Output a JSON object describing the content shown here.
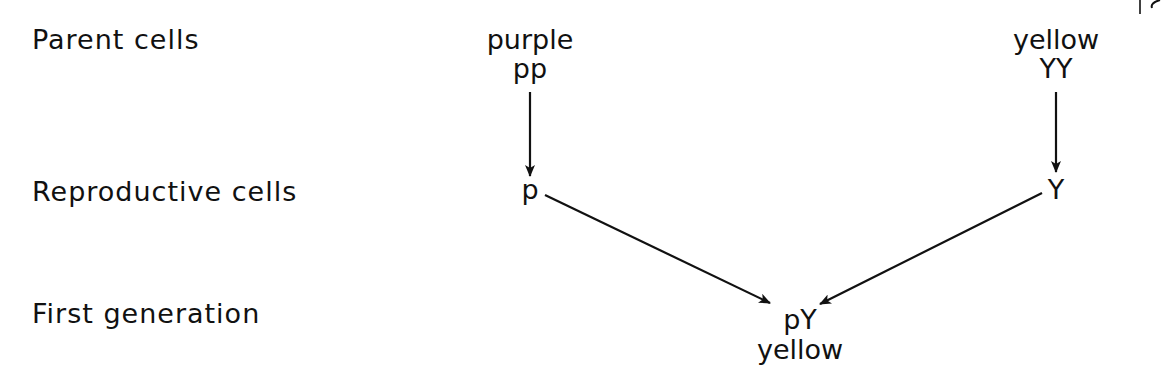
{
  "diagram": {
    "type": "genetic-cross",
    "row_labels": {
      "parent": "Parent cells",
      "reproductive": "Reproductive cells",
      "first_generation": "First generation"
    },
    "parents": [
      {
        "phenotype": "purple",
        "genotype": "pp",
        "gamete": "p"
      },
      {
        "phenotype": "yellow",
        "genotype": "YY",
        "gamete": "Y"
      }
    ],
    "offspring": {
      "genotype": "pY",
      "phenotype": "yellow"
    },
    "edges": [
      {
        "from": "pp",
        "to": "p"
      },
      {
        "from": "YY",
        "to": "Y"
      },
      {
        "from": "p",
        "to": "pY"
      },
      {
        "from": "Y",
        "to": "pY"
      }
    ],
    "colors": {
      "ink": "#111111",
      "background": "#ffffff"
    }
  }
}
